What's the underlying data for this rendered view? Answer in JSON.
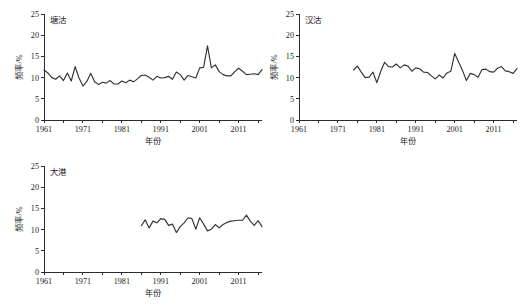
{
  "figure": {
    "background_color": "#ffffff",
    "line_color": "#333333",
    "axis_color": "#2b2b2b"
  },
  "chart_data": [
    {
      "type": "line",
      "title": "塘沽",
      "xlabel": "年份",
      "ylabel": "频率/%",
      "xlim": [
        1961,
        2017
      ],
      "ylim": [
        0,
        25
      ],
      "xticks": [
        1961,
        1971,
        1981,
        1991,
        2001,
        2011
      ],
      "yticks": [
        0,
        5,
        10,
        15,
        20,
        25
      ],
      "grid": false,
      "legend": "none",
      "x": [
        1961,
        1962,
        1963,
        1964,
        1965,
        1966,
        1967,
        1968,
        1969,
        1970,
        1971,
        1972,
        1973,
        1974,
        1975,
        1976,
        1977,
        1978,
        1979,
        1980,
        1981,
        1982,
        1983,
        1984,
        1985,
        1986,
        1987,
        1988,
        1989,
        1990,
        1991,
        1992,
        1993,
        1994,
        1995,
        1996,
        1997,
        1998,
        1999,
        2000,
        2001,
        2002,
        2003,
        2004,
        2005,
        2006,
        2007,
        2008,
        2009,
        2010,
        2011,
        2012,
        2013,
        2014,
        2015,
        2016,
        2017
      ],
      "values": [
        11.8,
        11.1,
        10.0,
        9.6,
        10.4,
        9.3,
        11.1,
        9.2,
        12.6,
        9.9,
        8.0,
        9.1,
        11.0,
        9.0,
        8.4,
        8.9,
        8.7,
        9.3,
        8.5,
        8.5,
        9.2,
        8.8,
        9.4,
        9.0,
        9.7,
        10.5,
        10.6,
        10.1,
        9.4,
        10.3,
        9.9,
        10.0,
        10.3,
        9.6,
        11.3,
        10.7,
        9.4,
        10.5,
        10.2,
        9.9,
        12.3,
        12.4,
        17.5,
        12.3,
        13.0,
        11.4,
        10.7,
        10.4,
        10.4,
        11.4,
        12.2,
        11.5,
        10.7,
        10.8,
        10.9,
        10.7,
        11.9
      ]
    },
    {
      "type": "line",
      "title": "汉沽",
      "xlabel": "年份",
      "ylabel": "频率/%",
      "xlim": [
        1961,
        2017
      ],
      "ylim": [
        0,
        25
      ],
      "xticks": [
        1961,
        1971,
        1981,
        1991,
        2001,
        2011
      ],
      "yticks": [
        0,
        5,
        10,
        15,
        20,
        25
      ],
      "grid": false,
      "legend": "none",
      "x": [
        1975,
        1976,
        1977,
        1978,
        1979,
        1980,
        1981,
        1982,
        1983,
        1984,
        1985,
        1986,
        1987,
        1988,
        1989,
        1990,
        1991,
        1992,
        1993,
        1994,
        1995,
        1996,
        1997,
        1998,
        1999,
        2000,
        2001,
        2002,
        2003,
        2004,
        2005,
        2006,
        2007,
        2008,
        2009,
        2010,
        2011,
        2012,
        2013,
        2014,
        2015,
        2016,
        2017
      ],
      "values": [
        11.8,
        12.7,
        11.3,
        10.0,
        10.1,
        11.3,
        8.8,
        11.5,
        13.6,
        12.6,
        12.5,
        13.2,
        12.3,
        13.0,
        12.7,
        11.5,
        12.3,
        12.1,
        11.3,
        11.2,
        10.4,
        9.7,
        10.6,
        9.9,
        11.1,
        11.5,
        15.7,
        13.7,
        11.7,
        9.3,
        11.0,
        10.7,
        10.1,
        11.9,
        12.0,
        11.4,
        11.3,
        12.2,
        12.6,
        11.6,
        11.4,
        11.0,
        12.1
      ]
    },
    {
      "type": "line",
      "title": "大港",
      "xlabel": "年份",
      "ylabel": "频率/%",
      "xlim": [
        1961,
        2017
      ],
      "ylim": [
        0,
        25
      ],
      "xticks": [
        1961,
        1971,
        1981,
        1991,
        2001,
        2011
      ],
      "yticks": [
        0,
        5,
        10,
        15,
        20,
        25
      ],
      "grid": false,
      "legend": "none",
      "x": [
        1986,
        1987,
        1988,
        1989,
        1990,
        1991,
        1992,
        1993,
        1994,
        1995,
        1996,
        1997,
        1998,
        1999,
        2000,
        2001,
        2002,
        2003,
        2004,
        2005,
        2006,
        2007,
        2008,
        2009,
        2010,
        2011,
        2012,
        2013,
        2014,
        2015,
        2016,
        2017
      ],
      "values": [
        10.9,
        12.3,
        10.4,
        12.0,
        11.6,
        12.6,
        12.4,
        11.0,
        11.3,
        9.3,
        10.7,
        11.6,
        12.8,
        12.6,
        10.1,
        12.8,
        11.3,
        9.7,
        10.1,
        11.2,
        10.4,
        11.2,
        11.7,
        12.0,
        12.1,
        12.2,
        12.2,
        13.4,
        12.0,
        11.0,
        12.1,
        10.7
      ]
    }
  ]
}
